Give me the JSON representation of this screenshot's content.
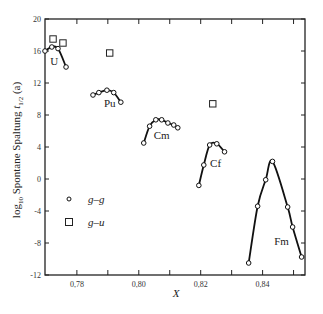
{
  "chart_data": {
    "type": "scatter",
    "title": "",
    "xlabel": "X",
    "ylabel": "log10 Spontane Spaltung t1/2 (a)",
    "ylabel_parts": {
      "pre": "log",
      "sub1": "10",
      "mid": " Spontane Spaltung ",
      "t": "t",
      "sub2": "1/2",
      "post": " (a)"
    },
    "xlim": [
      0.7697,
      0.8537
    ],
    "ylim": [
      -12,
      20
    ],
    "x_ticks": [
      0.78,
      0.8,
      0.82,
      0.84
    ],
    "x_tick_labels": [
      "0,78",
      "0,80",
      "0,82",
      "0,84"
    ],
    "x_minor_ticks": [
      0.79,
      0.81,
      0.83,
      0.85
    ],
    "y_ticks": [
      -12,
      -8,
      -4,
      0,
      4,
      8,
      12,
      16,
      20
    ],
    "y_tick_labels": [
      "-12",
      "-8",
      "-4",
      "0",
      "4",
      "8",
      "12",
      "16",
      "20"
    ],
    "grid": false,
    "legend": {
      "position": "lower-left-inside",
      "entries": [
        {
          "marker": "circle",
          "label": "g–g"
        },
        {
          "marker": "square",
          "label": "g–u"
        }
      ]
    },
    "series": [
      {
        "name": "U g-g",
        "element": "U",
        "marker": "circle",
        "connected": true,
        "x": [
          0.7697,
          0.7719,
          0.7739,
          0.7765
        ],
        "y": [
          16.0,
          16.5,
          16.3,
          14.0
        ]
      },
      {
        "name": "Pu g-g",
        "element": "Pu",
        "marker": "circle",
        "connected": true,
        "x": [
          0.7852,
          0.7871,
          0.7897,
          0.7919,
          0.7942
        ],
        "y": [
          10.5,
          10.8,
          11.1,
          10.8,
          9.6
        ]
      },
      {
        "name": "Cm g-g",
        "element": "Cm",
        "marker": "circle",
        "connected": true,
        "x": [
          0.8016,
          0.8035,
          0.8055,
          0.8074,
          0.8094,
          0.8113,
          0.8126
        ],
        "y": [
          4.5,
          6.6,
          7.4,
          7.4,
          7.0,
          6.75,
          6.4
        ]
      },
      {
        "name": "Cf g-g",
        "element": "Cf",
        "marker": "circle",
        "connected": true,
        "x": [
          0.8194,
          0.821,
          0.8229,
          0.8252,
          0.8277
        ],
        "y": [
          -0.8,
          1.75,
          4.25,
          4.4,
          3.4
        ]
      },
      {
        "name": "Fm g-g",
        "element": "Fm",
        "marker": "circle",
        "connected": true,
        "x": [
          0.8355,
          0.8384,
          0.841,
          0.8432,
          0.8481,
          0.8497,
          0.8526
        ],
        "y": [
          -10.5,
          -3.4,
          -0.1,
          2.2,
          -3.5,
          -6.0,
          -9.75
        ]
      },
      {
        "name": "g-u",
        "marker": "square",
        "connected": false,
        "x": [
          0.7723,
          0.7755,
          0.7906,
          0.8239
        ],
        "y": [
          17.5,
          17.0,
          15.75,
          9.4
        ]
      }
    ],
    "annotations": [
      {
        "text": "U",
        "x": 0.7727,
        "y": 14.2
      },
      {
        "text": "Pu",
        "x": 0.7906,
        "y": 9.0
      },
      {
        "text": "Cm",
        "x": 0.8074,
        "y": 5.0
      },
      {
        "text": "Cf",
        "x": 0.8248,
        "y": 1.5
      },
      {
        "text": "Fm",
        "x": 0.8461,
        "y": -8.3
      }
    ]
  }
}
